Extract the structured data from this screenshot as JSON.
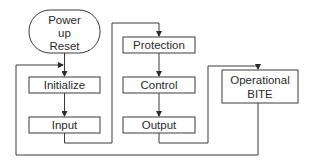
{
  "diagram": {
    "type": "flowchart",
    "nodes": {
      "start": {
        "lines": [
          "Power",
          "up",
          "Reset"
        ],
        "shape": "oval"
      },
      "initialize": {
        "label": "Initialize"
      },
      "input": {
        "label": "Input"
      },
      "protection": {
        "label": "Protection"
      },
      "control": {
        "label": "Control"
      },
      "output": {
        "label": "Output"
      },
      "bite": {
        "lines": [
          "Operational",
          "BITE"
        ]
      }
    },
    "edges": [
      {
        "from": "Power up Reset",
        "to": "Initialize"
      },
      {
        "from": "Initialize",
        "to": "Input"
      },
      {
        "from": "Input",
        "to": "Protection"
      },
      {
        "from": "Protection",
        "to": "Control"
      },
      {
        "from": "Control",
        "to": "Output"
      },
      {
        "from": "Output",
        "to": "Operational BITE"
      },
      {
        "from": "Operational BITE",
        "to": "Initialize/Input loop entry"
      }
    ],
    "colors": {
      "stroke": "#3a3a3a",
      "text": "#2a2a2a",
      "background": "#ffffff"
    }
  }
}
